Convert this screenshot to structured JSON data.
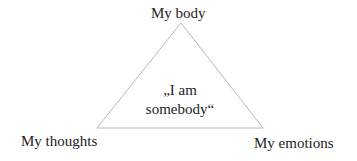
{
  "diagram": {
    "type": "triangle",
    "vertices": {
      "top": "My body",
      "left": "My thoughts",
      "right": "My emotions"
    },
    "center": {
      "line1": "„I am",
      "line2": "somebody“"
    },
    "colors": {
      "line": "#b8b8b8",
      "text": "#222222"
    }
  }
}
